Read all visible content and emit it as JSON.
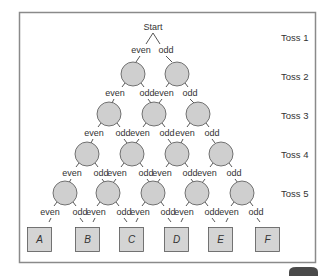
{
  "diagram": {
    "start_label": "Start",
    "branch_labels": {
      "even": "even",
      "odd": "odd"
    },
    "rows": [
      {
        "label": "Toss 1",
        "y": 38
      },
      {
        "label": "Toss 2",
        "y": 77
      },
      {
        "label": "Toss 3",
        "y": 116
      },
      {
        "label": "Toss 4",
        "y": 155
      },
      {
        "label": "Toss 5",
        "y": 194
      }
    ],
    "nodes": [
      {
        "row": 2,
        "xs": [
          133,
          177
        ]
      },
      {
        "row": 3,
        "xs": [
          109,
          154,
          198
        ]
      },
      {
        "row": 4,
        "xs": [
          87,
          132,
          177,
          221
        ]
      },
      {
        "row": 5,
        "xs": [
          65,
          108,
          153,
          197,
          242
        ]
      }
    ],
    "outcomes": [
      "A",
      "B",
      "C",
      "D",
      "E",
      "F"
    ],
    "colors": {
      "frame": "#8a8a8a",
      "node_fill": "#cfcfcf",
      "node_stroke": "#555555",
      "box_fill": "#d4d4d4",
      "box_stroke": "#555555",
      "corner_badge": "#4a4a4a"
    }
  }
}
